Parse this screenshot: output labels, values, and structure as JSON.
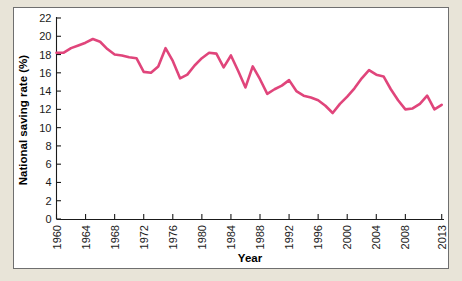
{
  "figure": {
    "background_color": "#e8e4d8",
    "panel_color": "#ffffff",
    "border_color": "#6f6f6f"
  },
  "chart_data": {
    "type": "line",
    "title": "",
    "xlabel": "Year",
    "ylabel": "National saving rate (%)",
    "xlim": [
      1960,
      2013
    ],
    "ylim": [
      0,
      22
    ],
    "grid": false,
    "legend": null,
    "line_color": "#e0457b",
    "x_tick_labels": [
      "1960",
      "1964",
      "1968",
      "1972",
      "1976",
      "1980",
      "1984",
      "1988",
      "1992",
      "1996",
      "2000",
      "2004",
      "2008",
      "2013"
    ],
    "x_ticks": [
      1960,
      1964,
      1968,
      1972,
      1976,
      1980,
      1984,
      1988,
      1992,
      1996,
      2000,
      2004,
      2008,
      2013
    ],
    "y_tick_labels": [
      "0",
      "2",
      "4",
      "6",
      "8",
      "10",
      "12",
      "14",
      "16",
      "18",
      "20",
      "22"
    ],
    "y_ticks": [
      0,
      2,
      4,
      6,
      8,
      10,
      12,
      14,
      16,
      18,
      20,
      22
    ],
    "x": [
      1960,
      1961,
      1962,
      1963,
      1964,
      1965,
      1966,
      1967,
      1968,
      1969,
      1970,
      1971,
      1972,
      1973,
      1974,
      1975,
      1976,
      1977,
      1978,
      1979,
      1980,
      1981,
      1982,
      1983,
      1984,
      1985,
      1986,
      1987,
      1988,
      1989,
      1990,
      1991,
      1992,
      1993,
      1994,
      1995,
      1996,
      1997,
      1998,
      1999,
      2000,
      2001,
      2002,
      2003,
      2004,
      2005,
      2006,
      2007,
      2008,
      2009,
      2010,
      2011,
      2012,
      2013
    ],
    "values": [
      18.2,
      18.2,
      18.7,
      19.0,
      19.3,
      19.7,
      19.4,
      18.6,
      18.0,
      17.9,
      17.7,
      17.6,
      16.1,
      16.0,
      16.7,
      18.7,
      17.3,
      15.4,
      15.8,
      16.8,
      17.6,
      18.2,
      18.1,
      16.6,
      17.9,
      16.2,
      14.4,
      16.7,
      15.3,
      13.7,
      14.2,
      14.6,
      15.2,
      14.0,
      13.5,
      13.3,
      13.0,
      12.4,
      11.6,
      12.6,
      13.4,
      14.3,
      15.4,
      16.3,
      15.8,
      15.6,
      14.2,
      13.0,
      12.0,
      12.1,
      12.6,
      13.5,
      12.0,
      12.5
    ],
    "series": [
      {
        "name": "National saving rate",
        "color": "#e0457b",
        "values": [
          18.2,
          18.2,
          18.7,
          19.0,
          19.3,
          19.7,
          19.4,
          18.6,
          18.0,
          17.9,
          17.7,
          17.6,
          16.1,
          16.0,
          16.7,
          18.7,
          17.3,
          15.4,
          15.8,
          16.8,
          17.6,
          18.2,
          18.1,
          16.6,
          17.9,
          16.2,
          14.4,
          16.7,
          15.3,
          13.7,
          14.2,
          14.6,
          15.2,
          14.0,
          13.5,
          13.3,
          13.0,
          12.4,
          11.6,
          12.6,
          13.4,
          14.3,
          15.4,
          16.3,
          15.8,
          15.6,
          14.2,
          13.0,
          12.0,
          12.1,
          12.6,
          13.5,
          12.0,
          12.5
        ]
      }
    ]
  }
}
